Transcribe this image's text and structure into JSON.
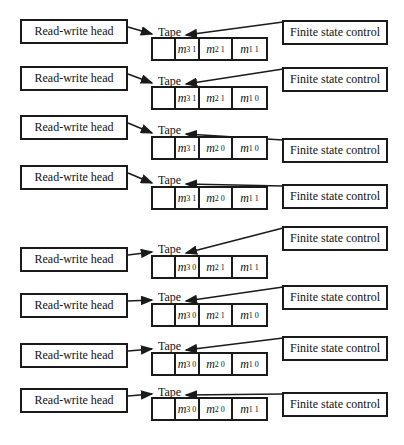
{
  "diagram": {
    "left_label": "Read-write head",
    "right_label": "Finite state control",
    "tape_label": "Tape",
    "panels": [
      {
        "cells": [
          {
            "sub": "3",
            "sup": "1"
          },
          {
            "sub": "2",
            "sup": "1"
          },
          {
            "sub": "1",
            "sup": "1"
          }
        ]
      },
      {
        "cells": [
          {
            "sub": "3",
            "sup": "1"
          },
          {
            "sub": "2",
            "sup": "1"
          },
          {
            "sub": "1",
            "sup": "0"
          }
        ]
      },
      {
        "cells": [
          {
            "sub": "3",
            "sup": "1"
          },
          {
            "sub": "2",
            "sup": "0"
          },
          {
            "sub": "1",
            "sup": "0"
          }
        ]
      },
      {
        "cells": [
          {
            "sub": "3",
            "sup": "1"
          },
          {
            "sub": "2",
            "sup": "0"
          },
          {
            "sub": "1",
            "sup": "1"
          }
        ]
      },
      {
        "cells": [
          {
            "sub": "3",
            "sup": "0"
          },
          {
            "sub": "2",
            "sup": "1"
          },
          {
            "sub": "1",
            "sup": "1"
          }
        ]
      },
      {
        "cells": [
          {
            "sub": "3",
            "sup": "0"
          },
          {
            "sub": "2",
            "sup": "1"
          },
          {
            "sub": "1",
            "sup": "0"
          }
        ]
      },
      {
        "cells": [
          {
            "sub": "3",
            "sup": "0"
          },
          {
            "sub": "2",
            "sup": "0"
          },
          {
            "sub": "1",
            "sup": "0"
          }
        ]
      },
      {
        "cells": [
          {
            "sub": "3",
            "sup": "0"
          },
          {
            "sub": "2",
            "sup": "0"
          },
          {
            "sub": "1",
            "sup": "1"
          }
        ]
      }
    ],
    "cell_symbol": "m",
    "line_color": "#1a1a1a"
  }
}
